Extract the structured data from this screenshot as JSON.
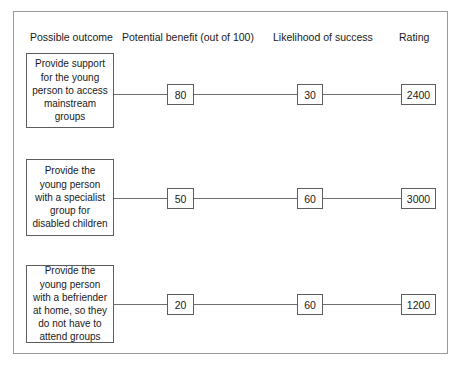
{
  "diagram": {
    "headers": {
      "outcome": "Possible outcome",
      "benefit": "Potential benefit (out of 100)",
      "likelihood": "Likelihood of success",
      "rating": "Rating"
    },
    "rows": [
      {
        "outcome": "Provide support for the young person to access mainstream groups",
        "benefit": "80",
        "likelihood": "30",
        "rating": "2400"
      },
      {
        "outcome": "Provide the young person with a specialist group for disabled children",
        "benefit": "50",
        "likelihood": "60",
        "rating": "3000"
      },
      {
        "outcome": "Provide the young person with a befriender at home, so they do not have to attend groups",
        "benefit": "20",
        "likelihood": "60",
        "rating": "1200"
      }
    ]
  },
  "chart_data": {
    "type": "table",
    "title": "",
    "columns": [
      "Possible outcome",
      "Potential benefit (out of 100)",
      "Likelihood of success",
      "Rating"
    ],
    "rows": [
      [
        "Provide support for the young person to access mainstream groups",
        80,
        30,
        2400
      ],
      [
        "Provide the young person with a specialist group for disabled children",
        50,
        60,
        3000
      ],
      [
        "Provide the young person with a befriender at home, so they do not have to attend groups",
        20,
        60,
        1200
      ]
    ]
  }
}
